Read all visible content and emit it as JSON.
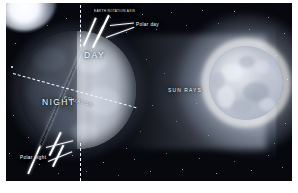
{
  "diagram": {
    "background_color": "#07080e",
    "frame_color": "#ffffff"
  },
  "labels": {
    "day": "DAY",
    "night": "NIGHT",
    "equator": "EQUATOR",
    "sun_rays": "SUN RAYS",
    "polar_day": "Polar day",
    "polar_night": "Polar night",
    "axis_top": "EARTH ROTATION AXIS"
  },
  "bodies": {
    "earth": {
      "name": "Earth",
      "day_side": "right",
      "night_side": "left",
      "axial_tilt_degrees": 23.5,
      "equator_tilt_degrees": 15.5,
      "lit_color": "#e8eef8",
      "dark_color": "#4a515e"
    },
    "sun": {
      "name": "Sun",
      "glow_color": "#ffffff",
      "surface_color": "#c2c8d4"
    }
  },
  "elements": {
    "rotation_axis": "rotation-axis",
    "terminator_reference": "vertical-dashed-reference-line",
    "equator_line": "dashed-equator-line",
    "ray_band": "sun-ray-band",
    "starfield": "starfield"
  }
}
